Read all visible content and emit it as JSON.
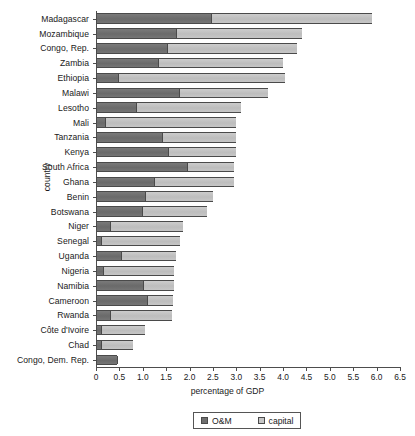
{
  "chart_data": {
    "type": "bar",
    "orientation": "horizontal",
    "stacked": true,
    "title": "",
    "xlabel": "percentage of GDP",
    "ylabel": "country",
    "xlim": [
      0,
      6.5
    ],
    "grid": false,
    "legend_position": "bottom",
    "xticks": [
      "0",
      "0.5",
      "1.0",
      "1.5",
      "2.0",
      "2.5",
      "3.0",
      "3.5",
      "4.0",
      "4.5",
      "5.0",
      "5.5",
      "6.0",
      "6.5"
    ],
    "xtick_values": [
      0,
      0.5,
      1.0,
      1.5,
      2.0,
      2.5,
      3.0,
      3.5,
      4.0,
      4.5,
      5.0,
      5.5,
      6.0,
      6.5
    ],
    "categories": [
      "Madagascar",
      "Mozambique",
      "Congo, Rep.",
      "Zambia",
      "Ethiopia",
      "Malawi",
      "Lesotho",
      "Mali",
      "Tanzania",
      "Kenya",
      "South Africa",
      "Ghana",
      "Benin",
      "Botswana",
      "Niger",
      "Senegal",
      "Uganda",
      "Nigeria",
      "Namibia",
      "Cameroon",
      "Rwanda",
      "Côte d'Ivoire",
      "Chad",
      "Congo, Dem. Rep."
    ],
    "series": [
      {
        "name": "O&M",
        "color": "#6f6f6f",
        "values": [
          2.45,
          1.72,
          1.52,
          1.32,
          0.47,
          1.77,
          0.85,
          0.2,
          1.41,
          1.54,
          1.95,
          1.25,
          1.05,
          0.98,
          0.3,
          0.1,
          0.54,
          0.15,
          1.0,
          1.09,
          0.3,
          0.1,
          0.1,
          0.45
        ]
      },
      {
        "name": "capital",
        "color": "#c6c6c6",
        "values": [
          3.45,
          2.68,
          2.78,
          2.68,
          3.58,
          1.91,
          2.25,
          2.8,
          1.59,
          1.46,
          1.0,
          1.7,
          1.45,
          1.39,
          1.57,
          1.7,
          1.18,
          1.51,
          0.67,
          0.56,
          1.32,
          0.95,
          0.7,
          0.0
        ]
      }
    ],
    "totals": [
      5.9,
      4.4,
      4.3,
      4.0,
      4.05,
      3.68,
      3.1,
      3.0,
      3.0,
      3.0,
      2.95,
      2.95,
      2.5,
      2.37,
      1.87,
      1.8,
      1.72,
      1.66,
      1.67,
      1.65,
      1.62,
      1.05,
      0.8,
      0.45
    ]
  },
  "legend": {
    "items": [
      {
        "label": "O&M",
        "swatch": "om-swatch"
      },
      {
        "label": "capital",
        "swatch": "capital-swatch"
      }
    ]
  },
  "axes": {
    "x_title": "percentage of GDP",
    "y_title": "country"
  }
}
